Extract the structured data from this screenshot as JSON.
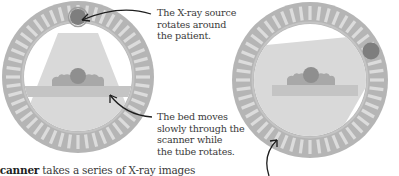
{
  "diagram": {
    "colors": {
      "ring_outer": "#b8b8b8",
      "ring_slat_light": "#d8d8d8",
      "ring_slat_dark": "#a9a9a9",
      "beam": "#dcdcdc",
      "bed": "#c6c6c6",
      "patient_body": "#a6a6a6",
      "patient_head": "#8c8c8c",
      "xray_source": "#7d7d7d",
      "arrow": "#222222",
      "text": "#3a3a3a"
    },
    "panels": [
      {
        "id": "left",
        "description": "X-ray source at top of gantry, beam pointing down through patient"
      },
      {
        "id": "right",
        "description": "X-ray source rotated to upper-right of gantry, beam angled across patient"
      }
    ],
    "annotations": {
      "source": {
        "lines": [
          "The X-ray source",
          "rotates around",
          "the patient."
        ]
      },
      "bed": {
        "lines": [
          "The bed moves",
          "slowly through the",
          "scanner while",
          "the tube rotates."
        ]
      }
    },
    "caption": {
      "bold_word": "scanner",
      "text": " takes a series of X-ray images"
    }
  }
}
